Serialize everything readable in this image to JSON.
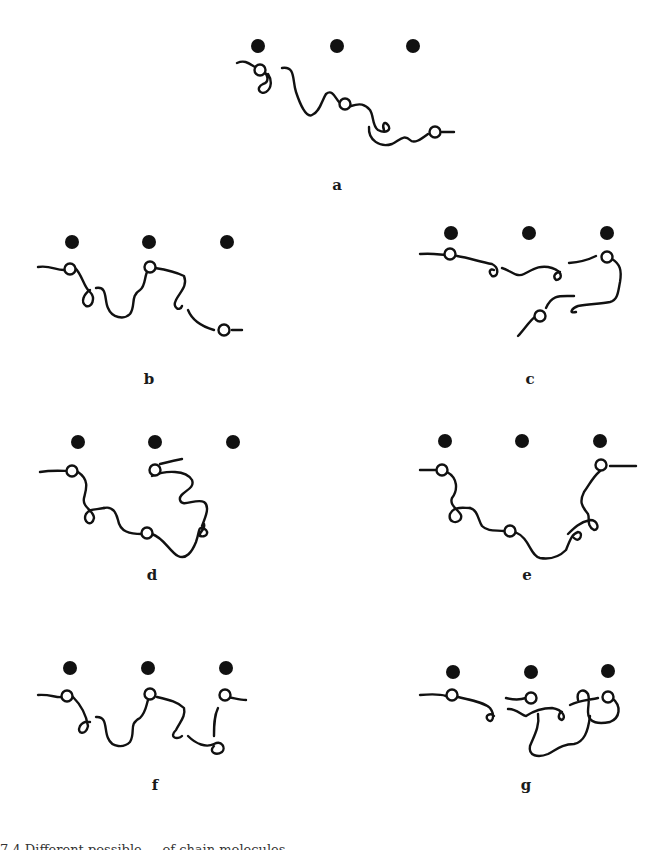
{
  "figure": {
    "panels": [
      {
        "id": "a",
        "label": "a",
        "label_x": 337,
        "label_y": 178
      },
      {
        "id": "b",
        "label": "b",
        "label_x": 149,
        "label_y": 372
      },
      {
        "id": "c",
        "label": "c",
        "label_x": 530,
        "label_y": 372
      },
      {
        "id": "d",
        "label": "d",
        "label_x": 152,
        "label_y": 568
      },
      {
        "id": "e",
        "label": "e",
        "label_x": 527,
        "label_y": 568
      },
      {
        "id": "f",
        "label": "f",
        "label_x": 155,
        "label_y": 778
      },
      {
        "id": "g",
        "label": "g",
        "label_x": 526,
        "label_y": 778
      }
    ],
    "legend_semantics": {
      "filled_circle": "adsorption site",
      "open_circle": "adsorbed segment",
      "curve": "chain molecule"
    },
    "colors": {
      "ink": "#111111",
      "background": "#ffffff"
    },
    "caption": "7.4  Different possible ... of chain molecules ..."
  }
}
